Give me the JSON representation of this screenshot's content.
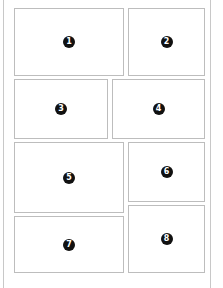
{
  "diagram": {
    "type": "layout-grid",
    "panels": [
      {
        "id": 1,
        "label": "1",
        "x": 14,
        "y": 8,
        "w": 110,
        "h": 68
      },
      {
        "id": 2,
        "label": "2",
        "x": 128,
        "y": 8,
        "w": 77,
        "h": 68
      },
      {
        "id": 3,
        "label": "3",
        "x": 14,
        "y": 79,
        "w": 94,
        "h": 60
      },
      {
        "id": 4,
        "label": "4",
        "x": 112,
        "y": 79,
        "w": 93,
        "h": 60
      },
      {
        "id": 5,
        "label": "5",
        "x": 14,
        "y": 142,
        "w": 110,
        "h": 71
      },
      {
        "id": 6,
        "label": "6",
        "x": 128,
        "y": 142,
        "w": 77,
        "h": 60
      },
      {
        "id": 7,
        "label": "7",
        "x": 14,
        "y": 216,
        "w": 110,
        "h": 57
      },
      {
        "id": 8,
        "label": "8",
        "x": 128,
        "y": 205,
        "w": 77,
        "h": 68
      }
    ],
    "colors": {
      "border": "#bdbdbd",
      "badge": "#111111",
      "badge_text": "#ffffff",
      "frame": "#c8c8c8"
    }
  }
}
